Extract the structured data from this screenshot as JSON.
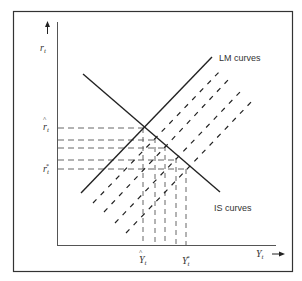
{
  "diagram": {
    "type": "IS-LM diagram",
    "y_axis": {
      "label": "r",
      "label_sub": "t"
    },
    "x_axis": {
      "label": "Y",
      "label_sub": "t"
    },
    "curve_labels": {
      "lm": "LM curves",
      "is": "IS curves"
    },
    "y_ticks": [
      {
        "name": "r-hat",
        "symbol": "r",
        "sub": "t",
        "marker": "hat"
      },
      {
        "name": "r-star",
        "symbol": "r",
        "sub": "t",
        "marker": "*"
      }
    ],
    "x_ticks": [
      {
        "name": "y-hat",
        "symbol": "Y",
        "sub": "t",
        "marker": "hat"
      },
      {
        "name": "y-star",
        "symbol": "Y",
        "sub": "t",
        "marker": "*"
      }
    ],
    "lm_curves": {
      "solid_count": 1,
      "dashed_count": 4
    },
    "horizontal_guides": 5,
    "vertical_guides": 4,
    "colors": {
      "line": "#222222",
      "frame": "#333333",
      "dash": "#444444",
      "text": "#333333"
    }
  }
}
